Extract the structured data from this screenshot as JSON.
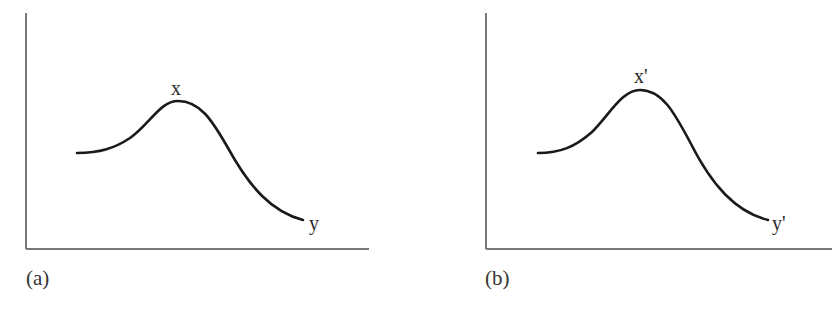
{
  "figure": {
    "panels": [
      {
        "id": "a",
        "caption": "(a)",
        "peak_label": "x",
        "end_label": "y",
        "curve": "bell-shaped curve rising from a moderate level to a peak then falling to a low end"
      },
      {
        "id": "b",
        "caption": "(b)",
        "peak_label": "x'",
        "end_label": "y'",
        "curve": "bell-shaped curve with a higher peak than panel (a), then falling to a low end"
      }
    ],
    "colors": {
      "axis": "#777777",
      "curve": "#1a1a1a",
      "background": "#ffffff"
    }
  }
}
